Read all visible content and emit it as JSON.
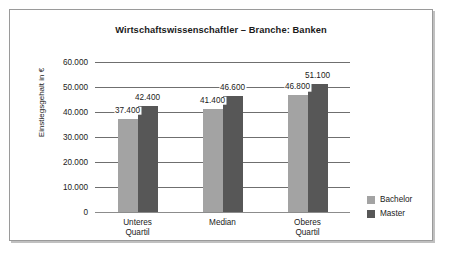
{
  "chart_data": {
    "type": "bar",
    "title": "Wirtschaftswissenschaftler – Branche: Banken",
    "xlabel": "",
    "ylabel": "Einstiegsgehalt in €",
    "categories": [
      "Unteres\nQuartil",
      "Median",
      "Oberes\nQuartil"
    ],
    "series": [
      {
        "name": "Bachelor",
        "color": "#a3a3a3",
        "values": [
          37400,
          41400,
          46800
        ],
        "labels": [
          "37.400",
          "41.400",
          "46.800"
        ]
      },
      {
        "name": "Master",
        "color": "#575757",
        "values": [
          42400,
          46600,
          51100
        ],
        "labels": [
          "42.400",
          "46.600",
          "51.100"
        ]
      }
    ],
    "ylim": [
      0,
      60000
    ],
    "yticks": [
      0,
      10000,
      20000,
      30000,
      40000,
      50000,
      60000
    ],
    "ytick_labels": [
      "0",
      "10.000",
      "20.000",
      "30.000",
      "40.000",
      "50.000",
      "60.000"
    ],
    "grid": true,
    "legend_position": "right"
  },
  "legend": {
    "items": [
      {
        "label": "Bachelor",
        "color": "#a3a3a3"
      },
      {
        "label": "Master",
        "color": "#575757"
      }
    ]
  }
}
